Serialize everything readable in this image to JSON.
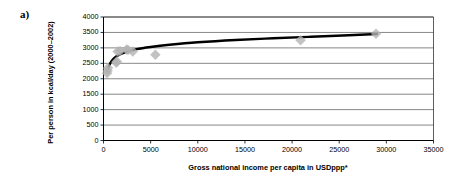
{
  "figure": {
    "panel_label": "a)"
  },
  "chart_data": {
    "type": "scatter",
    "title": "",
    "xlabel": "Gross national income per capita in USDppp*",
    "ylabel": "Per person in kcal/day (2000–2002)",
    "xlim": [
      0,
      35000
    ],
    "ylim": [
      0,
      4000
    ],
    "xticks": [
      0,
      5000,
      10000,
      15000,
      20000,
      25000,
      30000,
      35000
    ],
    "xtick_labels": [
      "0",
      "5000",
      "10000",
      "15000",
      "20000",
      "25000",
      "30000",
      "35000"
    ],
    "yticks": [
      0,
      500,
      1000,
      1500,
      2000,
      2500,
      3000,
      3500,
      4000
    ],
    "ytick_labels": [
      "0",
      "500",
      "1000",
      "1500",
      "2000",
      "2500",
      "3000",
      "3500",
      "4000"
    ],
    "grid": "horizontal",
    "legend": "none",
    "marker": {
      "shape": "diamond",
      "color": "#b3b3b3",
      "size": 5
    },
    "points": [
      {
        "x": 380,
        "y": 2180
      },
      {
        "x": 430,
        "y": 2260
      },
      {
        "x": 480,
        "y": 2350
      },
      {
        "x": 1350,
        "y": 2520
      },
      {
        "x": 1420,
        "y": 2560
      },
      {
        "x": 1500,
        "y": 2880
      },
      {
        "x": 1750,
        "y": 2900
      },
      {
        "x": 2450,
        "y": 2950
      },
      {
        "x": 2600,
        "y": 2930
      },
      {
        "x": 3100,
        "y": 2880
      },
      {
        "x": 5500,
        "y": 2780
      },
      {
        "x": 20900,
        "y": 3250
      },
      {
        "x": 28900,
        "y": 3460
      }
    ],
    "trend": {
      "type": "logarithmic",
      "color": "#000000",
      "width": 2.4,
      "description": "Logarithmic fit rising from ~2250 kcal/day near 400 USDppp to ~3450 kcal/day at 29000 USDppp",
      "path": [
        {
          "x": 400,
          "y": 2245
        },
        {
          "x": 600,
          "y": 2430
        },
        {
          "x": 900,
          "y": 2590
        },
        {
          "x": 1300,
          "y": 2710
        },
        {
          "x": 1800,
          "y": 2800
        },
        {
          "x": 2500,
          "y": 2880
        },
        {
          "x": 3500,
          "y": 2960
        },
        {
          "x": 5000,
          "y": 3030
        },
        {
          "x": 7000,
          "y": 3100
        },
        {
          "x": 10000,
          "y": 3180
        },
        {
          "x": 14000,
          "y": 3255
        },
        {
          "x": 18000,
          "y": 3310
        },
        {
          "x": 22000,
          "y": 3360
        },
        {
          "x": 26000,
          "y": 3410
        },
        {
          "x": 29000,
          "y": 3450
        }
      ]
    }
  }
}
